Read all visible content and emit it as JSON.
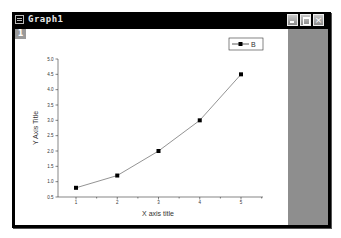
{
  "window": {
    "title": "Graph1",
    "layer_tab": "1",
    "buttons": {
      "minimize": "minimize",
      "restore": "restore",
      "close": "×"
    }
  },
  "chart_data": {
    "type": "line",
    "title": "",
    "xlabel": "X axis title",
    "ylabel": "Y Axis Title",
    "x": [
      1,
      2,
      3,
      4,
      5
    ],
    "series": [
      {
        "name": "B",
        "values": [
          0.8,
          1.2,
          2.0,
          3.0,
          4.5
        ],
        "marker": "square",
        "line_color": "#666666",
        "marker_color": "#000000"
      }
    ],
    "xlim": [
      0.6,
      5.5
    ],
    "ylim": [
      0.5,
      5.0
    ],
    "xticks": [
      "1",
      "2",
      "3",
      "4",
      "5"
    ],
    "yticks": [
      "0.5",
      "1.0",
      "1.5",
      "2.0",
      "2.5",
      "3.0",
      "3.5",
      "4.0",
      "4.5",
      "5.0"
    ],
    "grid": false,
    "legend_position": "top-right"
  }
}
